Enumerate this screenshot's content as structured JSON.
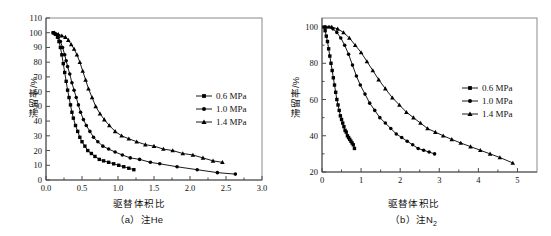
{
  "figure": {
    "panels": [
      "a",
      "b"
    ]
  },
  "panel_a": {
    "caption": "（a）注He",
    "xlabel": "驱替体积比",
    "ylabel": "滞留率/%",
    "legend": [
      {
        "label": "0.6 MPa",
        "marker": "square"
      },
      {
        "label": "1.0 MPa",
        "marker": "circle"
      },
      {
        "label": "1.4 MPa",
        "marker": "triangle"
      }
    ],
    "xticks": [
      "0.0",
      "0.5",
      "1.0",
      "1.5",
      "2.0",
      "2.5",
      "3.0"
    ],
    "yticks": [
      "0",
      "10",
      "20",
      "30",
      "40",
      "50",
      "60",
      "70",
      "80",
      "90",
      "100",
      "110"
    ]
  },
  "panel_b": {
    "caption_prefix": "（b）注N",
    "caption_sub": "2",
    "xlabel": "驱替体积比",
    "ylabel": "滞留率/%",
    "legend": [
      {
        "label": "0.6 MPa",
        "marker": "square"
      },
      {
        "label": "1.0 MPa",
        "marker": "circle"
      },
      {
        "label": "1.4 MPa",
        "marker": "triangle"
      }
    ],
    "xticks": [
      "0",
      "1",
      "2",
      "3",
      "4",
      "5"
    ],
    "yticks": [
      "20",
      "40",
      "60",
      "80",
      "100"
    ]
  },
  "colors": {
    "ink": "#000000",
    "frame": "#8a8a8a",
    "axis": "#4a4a4a",
    "background": "#ffffff"
  },
  "chart_data": [
    {
      "type": "line",
      "panel": "a",
      "title": "（a）注He",
      "xlabel": "驱替体积比",
      "ylabel": "滞留率/%",
      "xlim": [
        0.0,
        3.0
      ],
      "ylim": [
        0,
        110
      ],
      "xticks": [
        0.0,
        0.5,
        1.0,
        1.5,
        2.0,
        2.5,
        3.0
      ],
      "yticks": [
        0,
        10,
        20,
        30,
        40,
        50,
        60,
        70,
        80,
        90,
        100,
        110
      ],
      "grid": false,
      "legend_position": "center-right",
      "series": [
        {
          "name": "0.6 MPa",
          "marker": "square",
          "x": [
            0.1,
            0.13,
            0.16,
            0.18,
            0.2,
            0.22,
            0.24,
            0.26,
            0.28,
            0.3,
            0.32,
            0.34,
            0.36,
            0.38,
            0.41,
            0.44,
            0.47,
            0.5,
            0.54,
            0.58,
            0.63,
            0.68,
            0.74,
            0.8,
            0.87,
            0.94,
            1.01,
            1.08,
            1.15,
            1.22
          ],
          "y": [
            100,
            99,
            97,
            94,
            90,
            85,
            79,
            73,
            67,
            61,
            56,
            51,
            46,
            42,
            37,
            33,
            29,
            26,
            23,
            20,
            18,
            16,
            14,
            13,
            12,
            11,
            10,
            9,
            8,
            7
          ]
        },
        {
          "name": "1.0 MPa",
          "marker": "circle",
          "x": [
            0.1,
            0.14,
            0.17,
            0.2,
            0.23,
            0.26,
            0.28,
            0.3,
            0.33,
            0.36,
            0.39,
            0.42,
            0.45,
            0.48,
            0.52,
            0.56,
            0.61,
            0.66,
            0.72,
            0.79,
            0.87,
            0.96,
            1.06,
            1.17,
            1.3,
            1.45,
            1.58,
            1.82,
            2.1,
            2.38,
            2.63
          ],
          "y": [
            100,
            99,
            97,
            94,
            90,
            85,
            81,
            77,
            72,
            66,
            61,
            56,
            51,
            46,
            41,
            37,
            33,
            29,
            26,
            23,
            21,
            19,
            17,
            15,
            14,
            12,
            11,
            9,
            7,
            5,
            4
          ]
        },
        {
          "name": "1.4 MPa",
          "marker": "triangle",
          "x": [
            0.12,
            0.17,
            0.22,
            0.27,
            0.31,
            0.35,
            0.39,
            0.43,
            0.47,
            0.51,
            0.55,
            0.59,
            0.64,
            0.69,
            0.75,
            0.81,
            0.88,
            0.96,
            1.05,
            1.15,
            1.26,
            1.38,
            1.5,
            1.63,
            1.76,
            1.9,
            2.04,
            2.18,
            2.32,
            2.45
          ],
          "y": [
            100,
            99,
            98,
            97,
            95,
            92,
            89,
            85,
            80,
            74,
            68,
            62,
            56,
            50,
            45,
            41,
            37,
            33,
            30,
            28,
            26,
            24,
            23,
            21,
            20,
            18,
            17,
            15,
            13,
            12
          ]
        }
      ]
    },
    {
      "type": "line",
      "panel": "b",
      "title": "（b）注N2",
      "xlabel": "驱替体积比",
      "ylabel": "滞留率/%",
      "xlim": [
        0.0,
        5.5
      ],
      "ylim": [
        20,
        105
      ],
      "xticks": [
        0,
        1,
        2,
        3,
        4,
        5
      ],
      "yticks": [
        20,
        40,
        60,
        80,
        100
      ],
      "grid": false,
      "legend_position": "center-right",
      "series": [
        {
          "name": "0.6 MPa",
          "marker": "square",
          "x": [
            0.05,
            0.08,
            0.11,
            0.14,
            0.17,
            0.2,
            0.23,
            0.26,
            0.29,
            0.32,
            0.35,
            0.38,
            0.41,
            0.44,
            0.47,
            0.5,
            0.53,
            0.56,
            0.59,
            0.62,
            0.65,
            0.68,
            0.71,
            0.74,
            0.77,
            0.8,
            0.83
          ],
          "y": [
            100,
            98,
            95,
            92,
            88,
            84,
            80,
            76,
            72,
            68,
            64,
            60,
            57,
            54,
            51,
            49,
            47,
            45,
            43,
            42,
            40,
            39,
            38,
            37,
            36,
            35,
            33
          ]
        },
        {
          "name": "1.0 MPa",
          "marker": "circle",
          "x": [
            0.08,
            0.18,
            0.28,
            0.38,
            0.48,
            0.58,
            0.68,
            0.78,
            0.88,
            0.98,
            1.1,
            1.22,
            1.35,
            1.48,
            1.62,
            1.76,
            1.9,
            2.04,
            2.18,
            2.32,
            2.46,
            2.6,
            2.74,
            2.88
          ],
          "y": [
            100,
            100,
            99,
            97,
            94,
            90,
            85,
            79,
            73,
            68,
            63,
            58,
            54,
            50,
            47,
            44,
            41,
            39,
            37,
            35,
            33,
            32,
            31,
            30
          ]
        },
        {
          "name": "1.4 MPa",
          "marker": "triangle",
          "x": [
            0.1,
            0.25,
            0.4,
            0.55,
            0.7,
            0.85,
            1.0,
            1.15,
            1.3,
            1.45,
            1.62,
            1.8,
            1.98,
            2.16,
            2.34,
            2.52,
            2.7,
            2.9,
            3.1,
            3.32,
            3.55,
            3.8,
            4.05,
            4.3,
            4.55,
            4.88
          ],
          "y": [
            100,
            100,
            99,
            97,
            94,
            90,
            86,
            81,
            76,
            71,
            66,
            61,
            57,
            53,
            50,
            47,
            44,
            42,
            40,
            38,
            36,
            34,
            32,
            30,
            28,
            25
          ]
        }
      ]
    }
  ]
}
